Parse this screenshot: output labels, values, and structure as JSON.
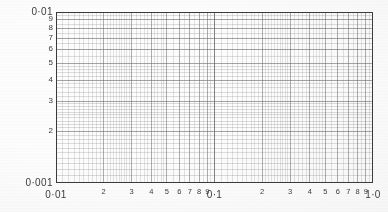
{
  "document": {
    "kind": "log-log graph paper",
    "background_color": "#ffffff",
    "grid_color": "#6e6e6e",
    "frame_color": "#3a3a3a",
    "label_color": "#3b3b3b"
  },
  "chart_data": {
    "type": "line",
    "title": "",
    "subtitle": "",
    "xlabel": "",
    "ylabel": "",
    "xscale": "log",
    "yscale": "log",
    "xlim": [
      0.01,
      1.0
    ],
    "ylim": [
      0.001,
      0.01
    ],
    "grid": true,
    "legend": null,
    "series": [],
    "annotations": [],
    "x_decades": 2,
    "y_decades": 1,
    "x_tick_labels": [
      "0·01",
      "2",
      "3",
      "4",
      "5",
      "6",
      "7",
      "8",
      "9",
      "0·1",
      "2",
      "3",
      "4",
      "5",
      "6",
      "7",
      "8",
      "9",
      "1·0"
    ],
    "x_tick_values": [
      0.01,
      0.02,
      0.03,
      0.04,
      0.05,
      0.06,
      0.07,
      0.08,
      0.09,
      0.1,
      0.2,
      0.3,
      0.4,
      0.5,
      0.6,
      0.7,
      0.8,
      0.9,
      1.0
    ],
    "y_tick_labels": [
      "0·01",
      "9",
      "8",
      "7",
      "6",
      "5",
      "4",
      "3",
      "2",
      "0·001"
    ],
    "y_tick_values": [
      0.01,
      0.009,
      0.008,
      0.007,
      0.006,
      0.005,
      0.004,
      0.003,
      0.002,
      0.001
    ]
  },
  "axes": {
    "y": {
      "top_label": "0·01",
      "bottom_label": "0·001",
      "minor_labels": [
        "9",
        "8",
        "7",
        "6",
        "5",
        "4",
        "3",
        "2"
      ]
    },
    "x": {
      "start_label": "0·01",
      "mid_label": "0·1",
      "end_label": "1·0",
      "decade1_minor": [
        "2",
        "3",
        "4",
        "5",
        "6",
        "7",
        "8",
        "9"
      ],
      "decade2_minor": [
        "2",
        "3",
        "4",
        "5",
        "6",
        "7",
        "8",
        "9"
      ]
    }
  }
}
